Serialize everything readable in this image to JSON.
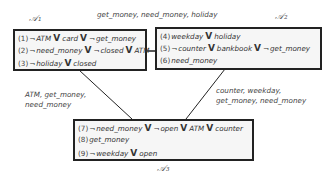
{
  "partitions": [
    {
      "name": "𝒜₁",
      "clauses": [
        {
          "num": "(1)",
          "literals": [
            {
              "neg": true,
              "atom": "ATM"
            },
            {
              "neg": false,
              "atom": "card"
            },
            {
              "neg": true,
              "atom": "get_money"
            }
          ]
        },
        {
          "num": "(2)",
          "literals": [
            {
              "neg": true,
              "atom": "need_money"
            },
            {
              "neg": true,
              "atom": "closed"
            },
            {
              "neg": false,
              "atom": "ATM"
            }
          ]
        },
        {
          "num": "(3)",
          "literals": [
            {
              "neg": true,
              "atom": "holiday"
            },
            {
              "neg": false,
              "atom": "closed"
            }
          ]
        }
      ]
    },
    {
      "name": "𝒜₂",
      "clauses": [
        {
          "num": "(4)",
          "literals": [
            {
              "neg": false,
              "atom": "weekday"
            },
            {
              "neg": false,
              "atom": "holiday"
            }
          ]
        },
        {
          "num": "(5)",
          "literals": [
            {
              "neg": true,
              "atom": "counter"
            },
            {
              "neg": false,
              "atom": "bankbook"
            },
            {
              "neg": true,
              "atom": "get_money"
            }
          ]
        },
        {
          "num": "(6)",
          "literals": [
            {
              "neg": false,
              "atom": "need_money"
            }
          ]
        }
      ]
    },
    {
      "name": "𝒜₃",
      "clauses": [
        {
          "num": "(7)",
          "literals": [
            {
              "neg": true,
              "atom": "need_money"
            },
            {
              "neg": true,
              "atom": "open"
            },
            {
              "neg": false,
              "atom": "ATM"
            },
            {
              "neg": false,
              "atom": "counter"
            }
          ]
        },
        {
          "num": "(8)",
          "literals": [
            {
              "neg": false,
              "atom": "get_money"
            }
          ]
        },
        {
          "num": "(9)",
          "literals": [
            {
              "neg": true,
              "atom": "weekday"
            },
            {
              "neg": false,
              "atom": "open"
            }
          ]
        }
      ]
    }
  ],
  "edges": [
    {
      "from": "A1",
      "to": "A2",
      "label_lines": [
        "get_money, need_money, holiday"
      ]
    },
    {
      "from": "A1",
      "to": "A3",
      "label_lines": [
        "ATM,  get_money,",
        "need_money"
      ]
    },
    {
      "from": "A2",
      "to": "A3",
      "label_lines": [
        "counter,  weekday,",
        "get_money,  need_money"
      ]
    }
  ],
  "symbols": {
    "neg": "¬",
    "or": "V"
  }
}
